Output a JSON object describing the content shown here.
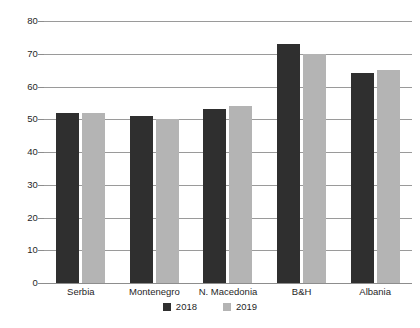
{
  "chart_data": {
    "type": "bar",
    "title": "",
    "subtitle": "",
    "xlabel": "",
    "ylabel": "",
    "categories": [
      "Serbia",
      "Montenegro",
      "N. Macedonia",
      "B&H",
      "Albania"
    ],
    "series": [
      {
        "name": "2018",
        "color": "#2f2f2f",
        "values": [
          52,
          51,
          53,
          73,
          64
        ]
      },
      {
        "name": "2019",
        "color": "#b4b4b4",
        "values": [
          52,
          50,
          54,
          70,
          65
        ]
      }
    ],
    "ylim": [
      0,
      80
    ],
    "ytick_labels": [
      "0",
      "10",
      "20",
      "30",
      "40",
      "50",
      "60",
      "70",
      "80"
    ],
    "ytick_values": [
      0,
      10,
      20,
      30,
      40,
      50,
      60,
      70,
      80
    ],
    "grid": true,
    "legend_position": "bottom",
    "legend_entries": [
      "2018",
      "2019"
    ],
    "annotations": []
  },
  "axis": {
    "y": {
      "t80": "80",
      "t70": "70",
      "t60": "60",
      "t50": "50",
      "t40": "40",
      "t30": "30",
      "t20": "20",
      "t10": "10",
      "t0": "0"
    },
    "x": {
      "c0": "Serbia",
      "c1": "Montenegro",
      "c2": "N. Macedonia",
      "c3": "B&H",
      "c4": "Albania"
    }
  },
  "legend": {
    "item0": "2018",
    "item1": "2019"
  },
  "colors": {
    "series_2018": "#2f2f2f",
    "series_2019": "#b4b4b4",
    "gridline": "#9a9a9a",
    "background": "#ffffff"
  }
}
